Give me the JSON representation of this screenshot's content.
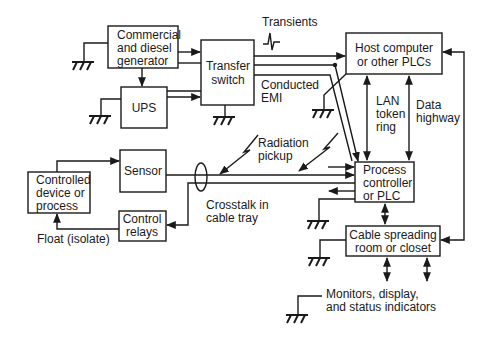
{
  "diagram": {
    "nodes": {
      "generator": {
        "lines": [
          "Commercial",
          "and diesel",
          "generator"
        ]
      },
      "ups": {
        "lines": [
          "UPS"
        ]
      },
      "transfer_switch": {
        "lines": [
          "Transfer",
          "switch"
        ]
      },
      "host_computer": {
        "lines": [
          "Host computer",
          "or other PLCs"
        ]
      },
      "sensor": {
        "lines": [
          "Sensor"
        ]
      },
      "controlled_device": {
        "lines": [
          "Controlled",
          "device or",
          "process"
        ]
      },
      "control_relays": {
        "lines": [
          "Control",
          "relays"
        ]
      },
      "process_controller": {
        "lines": [
          "Process",
          "controller",
          "or PLC"
        ]
      },
      "cable_spreading": {
        "lines": [
          "Cable spreading",
          "room or closet"
        ]
      }
    },
    "annotations": {
      "transients": "Transients",
      "conducted_emi": [
        "Conducted",
        "EMI"
      ],
      "lan_token_ring": [
        "LAN",
        "token",
        "ring"
      ],
      "data_highway": [
        "Data",
        "highway"
      ],
      "radiation_pickup": [
        "Radiation",
        "pickup"
      ],
      "crosstalk": [
        "Crosstalk in",
        "cable tray"
      ],
      "float": "Float (isolate)",
      "monitors": [
        "Monitors, display,",
        "and status indicators"
      ]
    },
    "colors": {
      "line": "#1a1a1a",
      "background": "#ffffff"
    }
  }
}
